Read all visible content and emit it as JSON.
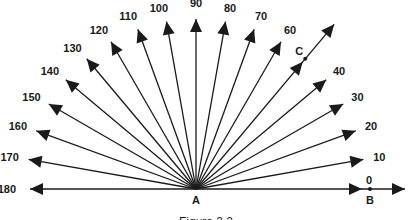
{
  "figure": {
    "caption": "Figure 2.2",
    "origin_label": "A",
    "point_b_label": "B",
    "point_c_label": "C",
    "angles": [
      0,
      10,
      20,
      30,
      40,
      60,
      70,
      80,
      90,
      100,
      110,
      120,
      130,
      140,
      150,
      160,
      170,
      180
    ],
    "angle_labels": [
      "0",
      "10",
      "20",
      "30",
      "40",
      "60",
      "70",
      "80",
      "90",
      "100",
      "110",
      "120",
      "130",
      "140",
      "150",
      "160",
      "170",
      "180"
    ],
    "ray_c_angle": 50,
    "line_color": "#1a1a1a"
  }
}
